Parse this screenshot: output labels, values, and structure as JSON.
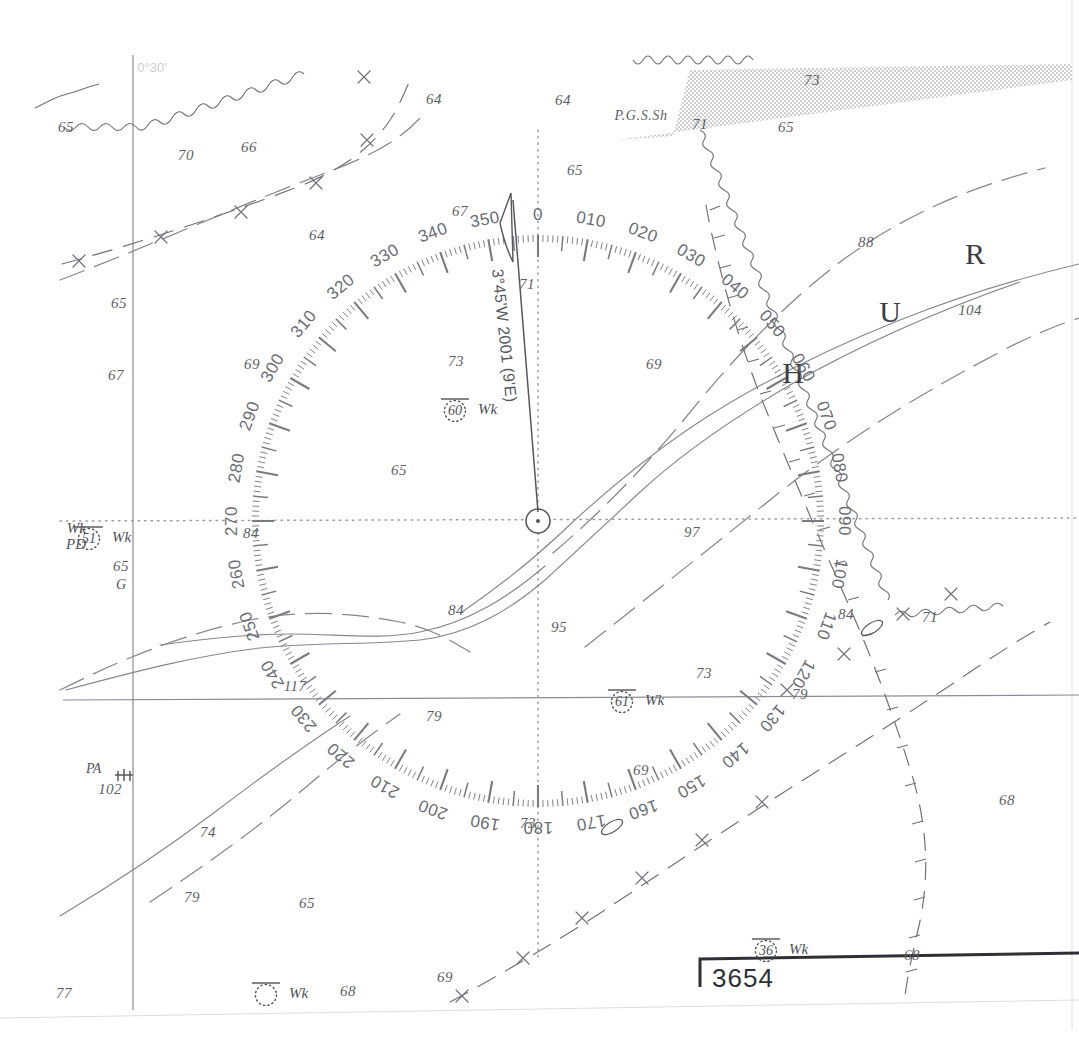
{
  "chart": {
    "chart_number": "3654",
    "magnetic_variation": "3°45'W 2001 (9'E)",
    "seabed_note": "P.G.S.Sh",
    "top_left_grid_label": "0°30'",
    "colors": {
      "paper": "#ffffff",
      "ink": "#5c5f66",
      "rose_ink": "#6a6d74",
      "heavy_ink": "#2e3035",
      "shoal_fill": "#d6d6d6"
    }
  },
  "compass_rose": {
    "center_x": 538,
    "center_y": 521,
    "radius": 286,
    "labels": [
      "0",
      "010",
      "020",
      "030",
      "040",
      "050",
      "060",
      "070",
      "080",
      "090",
      "100",
      "110",
      "120",
      "130",
      "140",
      "150",
      "160",
      "170",
      "180",
      "190",
      "200",
      "210",
      "220",
      "230",
      "240",
      "250",
      "260",
      "270",
      "280",
      "290",
      "300",
      "310",
      "320",
      "330",
      "340",
      "350"
    ]
  },
  "lettered_marks": [
    {
      "letter": "H",
      "x": 793,
      "y": 373
    },
    {
      "letter": "U",
      "x": 890,
      "y": 312
    },
    {
      "letter": "R",
      "x": 975,
      "y": 254
    }
  ],
  "soundings": [
    {
      "v": "65",
      "x": 66,
      "y": 127
    },
    {
      "v": "70",
      "x": 186,
      "y": 155
    },
    {
      "v": "66",
      "x": 249,
      "y": 147
    },
    {
      "v": "64",
      "x": 434,
      "y": 99
    },
    {
      "v": "64",
      "x": 563,
      "y": 100
    },
    {
      "v": "71",
      "x": 700,
      "y": 124
    },
    {
      "v": "73",
      "x": 812,
      "y": 80
    },
    {
      "v": "65",
      "x": 786,
      "y": 127
    },
    {
      "v": "65",
      "x": 575,
      "y": 170
    },
    {
      "v": "67",
      "x": 460,
      "y": 211
    },
    {
      "v": "64",
      "x": 317,
      "y": 235
    },
    {
      "v": "88",
      "x": 866,
      "y": 242
    },
    {
      "v": "104",
      "x": 970,
      "y": 310
    },
    {
      "v": "65",
      "x": 119,
      "y": 303
    },
    {
      "v": "67",
      "x": 116,
      "y": 375
    },
    {
      "v": "69",
      "x": 252,
      "y": 364
    },
    {
      "v": "73",
      "x": 456,
      "y": 361
    },
    {
      "v": "69",
      "x": 654,
      "y": 364
    },
    {
      "v": "71",
      "x": 527,
      "y": 284
    },
    {
      "v": "65",
      "x": 399,
      "y": 470
    },
    {
      "v": "84",
      "x": 251,
      "y": 533
    },
    {
      "v": "97",
      "x": 692,
      "y": 532
    },
    {
      "v": "84",
      "x": 456,
      "y": 610
    },
    {
      "v": "95",
      "x": 559,
      "y": 627
    },
    {
      "v": "84",
      "x": 846,
      "y": 614
    },
    {
      "v": "71",
      "x": 930,
      "y": 617
    },
    {
      "v": "117",
      "x": 295,
      "y": 686
    },
    {
      "v": "73",
      "x": 704,
      "y": 673
    },
    {
      "v": "79",
      "x": 800,
      "y": 694
    },
    {
      "v": "79",
      "x": 434,
      "y": 716
    },
    {
      "v": "102",
      "x": 110,
      "y": 789
    },
    {
      "v": "69",
      "x": 641,
      "y": 770
    },
    {
      "v": "68",
      "x": 1007,
      "y": 800
    },
    {
      "v": "74",
      "x": 208,
      "y": 832
    },
    {
      "v": "73",
      "x": 528,
      "y": 823
    },
    {
      "v": "79",
      "x": 192,
      "y": 897
    },
    {
      "v": "65",
      "x": 307,
      "y": 903
    },
    {
      "v": "68",
      "x": 912,
      "y": 955
    },
    {
      "v": "68",
      "x": 348,
      "y": 991
    },
    {
      "v": "69",
      "x": 445,
      "y": 977
    },
    {
      "v": "77",
      "x": 64,
      "y": 993
    },
    {
      "v": "65",
      "x": 121,
      "y": 566
    }
  ],
  "wrecks": [
    {
      "value": "60",
      "label": "Wk",
      "x": 466,
      "y": 409
    },
    {
      "value": "51",
      "label": "Wk",
      "prefix2": "PD",
      "x": 100,
      "y": 537
    },
    {
      "value": "61",
      "label": "Wk",
      "x": 633,
      "y": 700
    },
    {
      "value": "36",
      "label": "Wk",
      "x": 777,
      "y": 949
    },
    {
      "value": "",
      "label": "Wk",
      "x": 277,
      "y": 993
    }
  ],
  "annotations": {
    "pa_label_line1": "PA",
    "pa_label_line2": "102",
    "g_label": "G",
    "wk_pd_line1": "Wk",
    "wk_pd_line2": "PD"
  }
}
